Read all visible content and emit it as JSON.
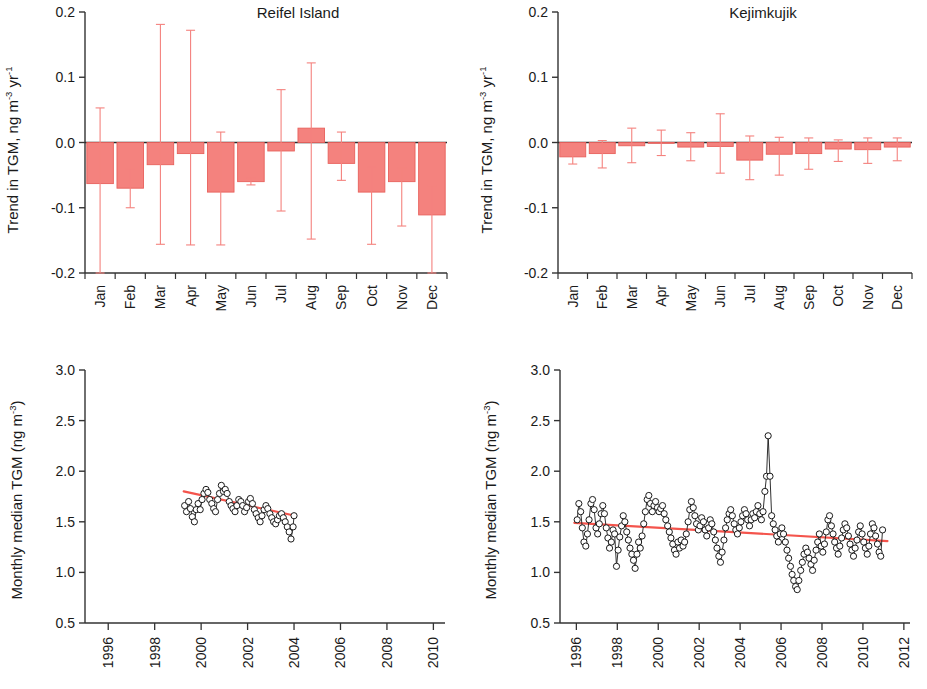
{
  "figure": {
    "panels": [
      "reifel-trend-bar",
      "kejimkujik-trend-bar",
      "reifel-timeseries",
      "kejimkujik-timeseries"
    ]
  },
  "axis_labels": {
    "trend_y": "Trend in TGM, ng m",
    "trend_y_sup1": "-3",
    "trend_y_mid": " yr",
    "trend_y_sup2": "-1",
    "median_y": "Monthly median TGM (ng m",
    "median_y_sup": "-3",
    "median_y_close": ")"
  },
  "colors": {
    "bar_fill": "#F4827E",
    "bar_edge": "#E8615C",
    "error_bar": "#F4827E",
    "trend_line": "#F4544C",
    "axis": "#333333",
    "marker_edge": "#1a1a1a",
    "marker_fill": "#ffffff"
  },
  "chart_data": [
    {
      "type": "bar",
      "id": "reifel-trend-bar",
      "title": "Reifel Island",
      "xlabel": "",
      "ylabel": "Trend in TGM, ng m-3 yr-1",
      "categories": [
        "Jan",
        "Feb",
        "Mar",
        "Apr",
        "May",
        "Jun",
        "Jul",
        "Aug",
        "Sep",
        "Oct",
        "Nov",
        "Dec"
      ],
      "values": [
        -0.063,
        -0.07,
        -0.034,
        -0.017,
        -0.076,
        -0.06,
        -0.013,
        0.022,
        -0.032,
        -0.076,
        -0.06,
        -0.111
      ],
      "err_low": [
        -0.2,
        -0.1,
        -0.156,
        -0.157,
        -0.157,
        -0.065,
        -0.105,
        -0.148,
        -0.058,
        -0.156,
        -0.128,
        -0.2
      ],
      "err_high": [
        0.053,
        -0.04,
        0.181,
        0.172,
        0.016,
        -0.054,
        0.081,
        0.122,
        0.016,
        -0.038,
        -0.039,
        -0.066
      ],
      "ylim": [
        -0.2,
        0.2
      ],
      "yticks": [
        -0.2,
        -0.1,
        0.0,
        0.1,
        0.2
      ],
      "ytick_labels": [
        "-0.2",
        "-0.1",
        "0.0",
        "0.1",
        "0.2"
      ],
      "grid": false,
      "legend": "none"
    },
    {
      "type": "bar",
      "id": "kejimkujik-trend-bar",
      "title": "Kejimkujik",
      "xlabel": "",
      "ylabel": "Trend in TGM, ng m-3 yr-1",
      "categories": [
        "Jan",
        "Feb",
        "Mar",
        "Apr",
        "May",
        "Jun",
        "Jul",
        "Aug",
        "Sep",
        "Oct",
        "Nov",
        "Dec"
      ],
      "values": [
        -0.022,
        -0.017,
        -0.005,
        0.0,
        -0.007,
        -0.006,
        -0.027,
        -0.018,
        -0.017,
        -0.01,
        -0.011,
        -0.007
      ],
      "err_low": [
        -0.033,
        -0.039,
        -0.031,
        -0.02,
        -0.028,
        -0.047,
        -0.057,
        -0.05,
        -0.041,
        -0.029,
        -0.032,
        -0.028
      ],
      "err_high": [
        -0.002,
        0.003,
        0.022,
        0.019,
        0.015,
        0.044,
        0.01,
        0.008,
        0.007,
        0.004,
        0.007,
        0.007
      ],
      "ylim": [
        -0.2,
        0.2
      ],
      "yticks": [
        -0.2,
        -0.1,
        0.0,
        0.1,
        0.2
      ],
      "ytick_labels": [
        "-0.2",
        "-0.1",
        "0.0",
        "0.1",
        "0.2"
      ],
      "grid": false,
      "legend": "none"
    },
    {
      "type": "line",
      "id": "reifel-timeseries",
      "title": "",
      "xlabel": "",
      "ylabel": "Monthly median TGM (ng m-3)",
      "xlim": [
        1995.0,
        2010.5
      ],
      "ylim": [
        0.5,
        3.0
      ],
      "xticks": [
        1996,
        1998,
        2000,
        2002,
        2004,
        2006,
        2008,
        2010
      ],
      "xtick_labels": [
        "1996",
        "1998",
        "2000",
        "2002",
        "2004",
        "2006",
        "2008",
        "2010"
      ],
      "yticks": [
        0.5,
        1.0,
        1.5,
        2.0,
        2.5,
        3.0
      ],
      "ytick_labels": [
        "0.5",
        "1.0",
        "1.5",
        "2.0",
        "2.5",
        "3.0"
      ],
      "grid": false,
      "legend": "none",
      "series": [
        {
          "name": "Monthly median TGM",
          "marker": "open-circle",
          "x": [
            1999.29,
            1999.37,
            1999.46,
            1999.54,
            1999.62,
            1999.71,
            1999.79,
            1999.87,
            1999.96,
            2000.04,
            2000.12,
            2000.21,
            2000.29,
            2000.37,
            2000.46,
            2000.54,
            2000.62,
            2000.71,
            2000.79,
            2000.87,
            2000.96,
            2001.04,
            2001.12,
            2001.21,
            2001.29,
            2001.37,
            2001.46,
            2001.54,
            2001.62,
            2001.71,
            2001.79,
            2001.87,
            2001.96,
            2002.04,
            2002.12,
            2002.21,
            2002.29,
            2002.37,
            2002.46,
            2002.54,
            2002.62,
            2002.71,
            2002.79,
            2002.87,
            2002.96,
            2003.04,
            2003.12,
            2003.21,
            2003.29,
            2003.37,
            2003.46,
            2003.54,
            2003.62,
            2003.71,
            2003.79,
            2003.87,
            2003.96,
            2004.0
          ],
          "y": [
            1.66,
            1.6,
            1.7,
            1.63,
            1.55,
            1.5,
            1.62,
            1.68,
            1.62,
            1.72,
            1.78,
            1.82,
            1.79,
            1.72,
            1.68,
            1.63,
            1.6,
            1.72,
            1.78,
            1.86,
            1.8,
            1.82,
            1.78,
            1.7,
            1.66,
            1.63,
            1.6,
            1.66,
            1.72,
            1.7,
            1.66,
            1.6,
            1.64,
            1.7,
            1.73,
            1.68,
            1.62,
            1.58,
            1.54,
            1.5,
            1.56,
            1.62,
            1.66,
            1.63,
            1.58,
            1.54,
            1.5,
            1.48,
            1.52,
            1.56,
            1.58,
            1.54,
            1.5,
            1.45,
            1.4,
            1.33,
            1.45,
            1.56
          ]
        }
      ],
      "trend_line": {
        "x": [
          1999.25,
          2004.05
        ],
        "y": [
          1.8,
          1.56
        ],
        "color": "#F4544C"
      }
    },
    {
      "type": "line",
      "id": "kejimkujik-timeseries",
      "title": "",
      "xlabel": "",
      "ylabel": "Monthly median TGM (ng m-3)",
      "xlim": [
        1995.2,
        2012.3
      ],
      "ylim": [
        0.5,
        3.0
      ],
      "xticks": [
        1996,
        1998,
        2000,
        2002,
        2004,
        2006,
        2008,
        2010,
        2012
      ],
      "xtick_labels": [
        "1996",
        "1998",
        "2000",
        "2002",
        "2004",
        "2006",
        "2008",
        "2010",
        "2012"
      ],
      "yticks": [
        0.5,
        1.0,
        1.5,
        2.0,
        2.5,
        3.0
      ],
      "ytick_labels": [
        "0.5",
        "1.0",
        "1.5",
        "2.0",
        "2.5",
        "3.0"
      ],
      "grid": false,
      "legend": "none",
      "series": [
        {
          "name": "Monthly median TGM",
          "marker": "open-circle",
          "x": [
            1996.04,
            1996.12,
            1996.21,
            1996.29,
            1996.37,
            1996.46,
            1996.54,
            1996.62,
            1996.71,
            1996.79,
            1996.87,
            1996.96,
            1997.04,
            1997.12,
            1997.21,
            1997.29,
            1997.37,
            1997.46,
            1997.54,
            1997.62,
            1997.71,
            1997.79,
            1997.87,
            1997.96,
            1998.04,
            1998.12,
            1998.21,
            1998.29,
            1998.37,
            1998.46,
            1998.54,
            1998.62,
            1998.71,
            1998.79,
            1998.87,
            1998.96,
            1999.04,
            1999.12,
            1999.21,
            1999.29,
            1999.37,
            1999.46,
            1999.54,
            1999.62,
            1999.71,
            1999.79,
            1999.87,
            1999.96,
            2000.04,
            2000.12,
            2000.21,
            2000.29,
            2000.37,
            2000.46,
            2000.54,
            2000.62,
            2000.71,
            2000.79,
            2000.87,
            2000.96,
            2001.04,
            2001.12,
            2001.21,
            2001.29,
            2001.37,
            2001.46,
            2001.54,
            2001.62,
            2001.71,
            2001.79,
            2001.87,
            2001.96,
            2002.04,
            2002.12,
            2002.21,
            2002.29,
            2002.37,
            2002.46,
            2002.54,
            2002.62,
            2002.71,
            2002.79,
            2002.87,
            2002.96,
            2003.04,
            2003.12,
            2003.21,
            2003.29,
            2003.37,
            2003.46,
            2003.54,
            2003.62,
            2003.71,
            2003.79,
            2003.87,
            2003.96,
            2004.04,
            2004.12,
            2004.21,
            2004.29,
            2004.37,
            2004.46,
            2004.54,
            2004.62,
            2004.71,
            2004.79,
            2004.87,
            2004.96,
            2005.04,
            2005.12,
            2005.21,
            2005.29,
            2005.37,
            2005.46,
            2005.54,
            2005.62,
            2005.71,
            2005.79,
            2005.87,
            2005.96,
            2006.04,
            2006.12,
            2006.21,
            2006.29,
            2006.37,
            2006.46,
            2006.54,
            2006.62,
            2006.71,
            2006.79,
            2006.87,
            2006.96,
            2007.04,
            2007.12,
            2007.21,
            2007.29,
            2007.37,
            2007.46,
            2007.54,
            2007.62,
            2007.71,
            2007.79,
            2007.87,
            2007.96,
            2008.04,
            2008.12,
            2008.21,
            2008.29,
            2008.37,
            2008.46,
            2008.54,
            2008.62,
            2008.71,
            2008.79,
            2008.87,
            2008.96,
            2009.04,
            2009.12,
            2009.21,
            2009.29,
            2009.37,
            2009.46,
            2009.54,
            2009.62,
            2009.71,
            2009.79,
            2009.87,
            2009.96,
            2010.04,
            2010.12,
            2010.21,
            2010.29,
            2010.37,
            2010.46,
            2010.54,
            2010.62,
            2010.71,
            2010.79,
            2010.87,
            2010.96
          ],
          "y": [
            1.52,
            1.68,
            1.6,
            1.44,
            1.3,
            1.26,
            1.38,
            1.52,
            1.68,
            1.72,
            1.62,
            1.44,
            1.38,
            1.48,
            1.58,
            1.66,
            1.58,
            1.44,
            1.34,
            1.24,
            1.3,
            1.42,
            1.38,
            1.06,
            1.22,
            1.35,
            1.46,
            1.56,
            1.5,
            1.4,
            1.32,
            1.24,
            1.18,
            1.12,
            1.04,
            1.18,
            1.3,
            1.24,
            1.36,
            1.48,
            1.6,
            1.72,
            1.76,
            1.68,
            1.6,
            1.66,
            1.7,
            1.64,
            1.6,
            1.63,
            1.66,
            1.58,
            1.52,
            1.46,
            1.4,
            1.34,
            1.28,
            1.22,
            1.18,
            1.3,
            1.24,
            1.32,
            1.26,
            1.3,
            1.38,
            1.5,
            1.62,
            1.7,
            1.64,
            1.56,
            1.48,
            1.42,
            1.46,
            1.54,
            1.5,
            1.42,
            1.36,
            1.44,
            1.52,
            1.48,
            1.4,
            1.32,
            1.24,
            1.16,
            1.1,
            1.2,
            1.32,
            1.44,
            1.52,
            1.58,
            1.62,
            1.56,
            1.48,
            1.42,
            1.38,
            1.44,
            1.5,
            1.56,
            1.62,
            1.58,
            1.52,
            1.46,
            1.52,
            1.58,
            1.54,
            1.6,
            1.66,
            1.58,
            1.52,
            1.6,
            1.8,
            1.95,
            2.35,
            1.95,
            1.56,
            1.48,
            1.42,
            1.36,
            1.3,
            1.38,
            1.44,
            1.38,
            1.3,
            1.22,
            1.14,
            1.06,
            0.98,
            0.92,
            0.86,
            0.83,
            0.92,
            1.02,
            1.1,
            1.18,
            1.24,
            1.2,
            1.14,
            1.08,
            1.02,
            1.12,
            1.22,
            1.3,
            1.38,
            1.26,
            1.2,
            1.28,
            1.4,
            1.52,
            1.56,
            1.46,
            1.38,
            1.3,
            1.24,
            1.18,
            1.26,
            1.34,
            1.42,
            1.48,
            1.44,
            1.36,
            1.28,
            1.22,
            1.16,
            1.24,
            1.32,
            1.4,
            1.46,
            1.38,
            1.3,
            1.24,
            1.18,
            1.26,
            1.38,
            1.48,
            1.44,
            1.36,
            1.28,
            1.2,
            1.16,
            1.42
          ]
        }
      ],
      "trend_line": {
        "x": [
          1995.9,
          2011.2
        ],
        "y": [
          1.49,
          1.31
        ],
        "color": "#F4544C"
      }
    }
  ]
}
